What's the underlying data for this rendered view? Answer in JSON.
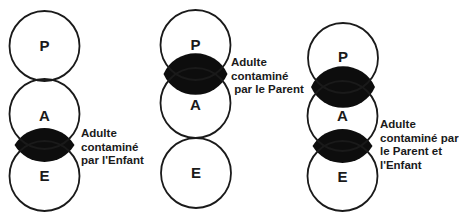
{
  "diagrams": [
    {
      "id": "left",
      "circles": [
        {
          "label": "P",
          "cx": 44.5,
          "cy": 46,
          "r": 35
        },
        {
          "label": "A",
          "cx": 44.5,
          "cy": 114,
          "r": 35
        },
        {
          "label": "E",
          "cx": 44.5,
          "cy": 176,
          "r": 35
        }
      ],
      "contaminations": [
        "A-E"
      ],
      "caption": [
        "Adulte",
        "contaminé",
        "par l'Enfant"
      ]
    },
    {
      "id": "middle",
      "circles": [
        {
          "label": "P",
          "cx": 195.5,
          "cy": 45,
          "r": 35
        },
        {
          "label": "A",
          "cx": 195.5,
          "cy": 103,
          "r": 35
        },
        {
          "label": "E",
          "cx": 196,
          "cy": 173,
          "r": 35
        }
      ],
      "contaminations": [
        "P-A"
      ],
      "caption": [
        "Adulte",
        "contaminé",
        " par le Parent"
      ]
    },
    {
      "id": "right",
      "circles": [
        {
          "label": "P",
          "cx": 343,
          "cy": 58,
          "r": 35
        },
        {
          "label": "A",
          "cx": 342.5,
          "cy": 116,
          "r": 35
        },
        {
          "label": "E",
          "cx": 342.5,
          "cy": 176,
          "r": 35
        }
      ],
      "contaminations": [
        "P-A",
        "A-E"
      ],
      "caption": [
        "Adulte",
        "contaminé par",
        "le Parent et",
        "l'Enfant"
      ]
    }
  ],
  "colors": {
    "stroke": "#1a1a1a",
    "lens": "#0d0d0d",
    "background": "#ffffff"
  }
}
